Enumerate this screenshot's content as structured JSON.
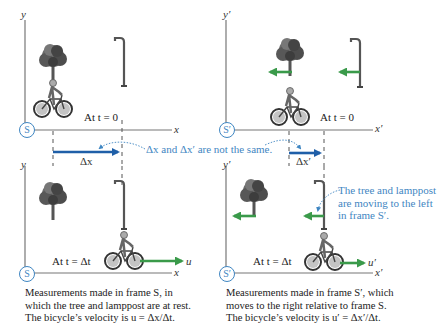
{
  "panels": {
    "top_left": {
      "frame": "S",
      "y_axis_label": "y",
      "x_axis_label": "x",
      "time_label": "At t = 0",
      "displacement_label": "Δx"
    },
    "top_right": {
      "frame": "S′",
      "y_axis_label": "y′",
      "x_axis_label": "x′",
      "time_label": "At t = 0",
      "displacement_label": "Δx′"
    },
    "bottom_left": {
      "frame": "S",
      "y_axis_label": "y",
      "x_axis_label": "x",
      "time_label": "At t = Δt",
      "velocity_label": "u"
    },
    "bottom_right": {
      "frame": "S′",
      "y_axis_label": "y′",
      "x_axis_label": "x′",
      "time_label": "At t = Δt",
      "velocity_label": "u′"
    }
  },
  "annotations": {
    "not_same": "Δx and Δx′ are not the same.",
    "moving_left": [
      "The tree and lamppost",
      "are moving to the left",
      "in frame S′."
    ]
  },
  "captions": {
    "left": [
      "Measurements made in frame S, in",
      "which the tree and lamppost are at rest.",
      "The bicycle’s velocity is u = Δx/Δt."
    ],
    "right": [
      "Measurements made in frame S′, which",
      "moves to the right relative to frame S.",
      "The bicycle’s velocity is u′ = Δx′/Δt."
    ]
  },
  "colors": {
    "frame_blue": "#3f86c2",
    "displacement_arrow": "#1f5fa8",
    "motion_arrow": "#3a9a4a",
    "axis": "#777777"
  }
}
